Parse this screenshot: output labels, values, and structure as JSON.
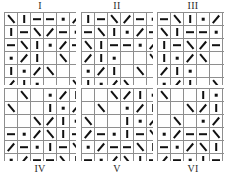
{
  "figure": {
    "title": "",
    "grid_rows": 6,
    "grid_cols": 6,
    "cell_px": 12,
    "glyph_legend": {
      "vert": "vertical stroke",
      "horz": "horizontal stroke",
      "back": "backslash stroke",
      "fwd": "forward slash stroke",
      "dot": "dot",
      "blank": "empty cell"
    },
    "colors": {
      "ink": "#111111",
      "outer_border": "#3a3a3a",
      "inner_border": "#8e8e8e",
      "background": "#ffffff",
      "label": "#2b2b2b"
    }
  },
  "panels": [
    {
      "label": "I",
      "label_position": "top",
      "clipped_right": false,
      "cells": [
        [
          "back",
          "vert",
          "horz",
          "horz",
          "dot",
          "fwd"
        ],
        [
          "vert",
          "horz",
          "back",
          "fwd",
          "horz",
          "dot"
        ],
        [
          "horz",
          "back",
          "vert",
          "dot",
          "fwd",
          "horz"
        ],
        [
          "dot",
          "fwd",
          "vert",
          "blank",
          "back",
          "blank"
        ],
        [
          "vert",
          "dot",
          "fwd",
          "back",
          "blank",
          "blank"
        ],
        [
          "fwd",
          "vert",
          "dot",
          "blank",
          "blank",
          "back"
        ]
      ]
    },
    {
      "label": "II",
      "label_position": "top",
      "clipped_right": false,
      "cells": [
        [
          "vert",
          "horz",
          "back",
          "fwd",
          "horz",
          "dot"
        ],
        [
          "horz",
          "back",
          "vert",
          "dot",
          "fwd",
          "horz"
        ],
        [
          "back",
          "vert",
          "horz",
          "horz",
          "dot",
          "fwd"
        ],
        [
          "fwd",
          "vert",
          "dot",
          "blank",
          "blank",
          "back"
        ],
        [
          "dot",
          "fwd",
          "vert",
          "blank",
          "back",
          "blank"
        ],
        [
          "vert",
          "dot",
          "fwd",
          "back",
          "blank",
          "blank"
        ]
      ]
    },
    {
      "label": "III",
      "label_position": "top",
      "clipped_right": true,
      "cells": [
        [
          "horz",
          "back",
          "vert",
          "dot",
          "fwd",
          "horz"
        ],
        [
          "back",
          "vert",
          "horz",
          "horz",
          "dot",
          "fwd"
        ],
        [
          "vert",
          "horz",
          "back",
          "fwd",
          "horz",
          "dot"
        ],
        [
          "vert",
          "dot",
          "fwd",
          "back",
          "blank",
          "blank"
        ],
        [
          "fwd",
          "vert",
          "dot",
          "blank",
          "blank",
          "back"
        ],
        [
          "dot",
          "fwd",
          "vert",
          "blank",
          "back",
          "blank"
        ]
      ]
    },
    {
      "label": "IV",
      "label_position": "bottom",
      "clipped_right": false,
      "cells": [
        [
          "blank",
          "back",
          "blank",
          "dot",
          "fwd",
          "vert"
        ],
        [
          "back",
          "blank",
          "blank",
          "vert",
          "dot",
          "fwd"
        ],
        [
          "blank",
          "blank",
          "back",
          "fwd",
          "vert",
          "dot"
        ],
        [
          "horz",
          "dot",
          "fwd",
          "back",
          "vert",
          "horz"
        ],
        [
          "fwd",
          "horz",
          "dot",
          "vert",
          "horz",
          "back"
        ],
        [
          "dot",
          "fwd",
          "horz",
          "horz",
          "back",
          "vert"
        ]
      ]
    },
    {
      "label": "V",
      "label_position": "bottom",
      "clipped_right": false,
      "cells": [
        [
          "blank",
          "blank",
          "back",
          "fwd",
          "vert",
          "dot"
        ],
        [
          "blank",
          "back",
          "blank",
          "dot",
          "fwd",
          "vert"
        ],
        [
          "back",
          "blank",
          "blank",
          "vert",
          "dot",
          "fwd"
        ],
        [
          "fwd",
          "horz",
          "dot",
          "vert",
          "horz",
          "back"
        ],
        [
          "dot",
          "fwd",
          "horz",
          "horz",
          "back",
          "vert"
        ],
        [
          "horz",
          "dot",
          "fwd",
          "back",
          "vert",
          "horz"
        ]
      ]
    },
    {
      "label": "VI",
      "label_position": "bottom",
      "clipped_right": true,
      "cells": [
        [
          "back",
          "blank",
          "blank",
          "vert",
          "dot",
          "fwd"
        ],
        [
          "blank",
          "blank",
          "back",
          "fwd",
          "vert",
          "dot"
        ],
        [
          "blank",
          "back",
          "blank",
          "dot",
          "fwd",
          "vert"
        ],
        [
          "dot",
          "fwd",
          "horz",
          "horz",
          "back",
          "vert"
        ],
        [
          "horz",
          "dot",
          "fwd",
          "back",
          "vert",
          "horz"
        ],
        [
          "fwd",
          "horz",
          "dot",
          "vert",
          "horz",
          "back"
        ]
      ]
    }
  ]
}
